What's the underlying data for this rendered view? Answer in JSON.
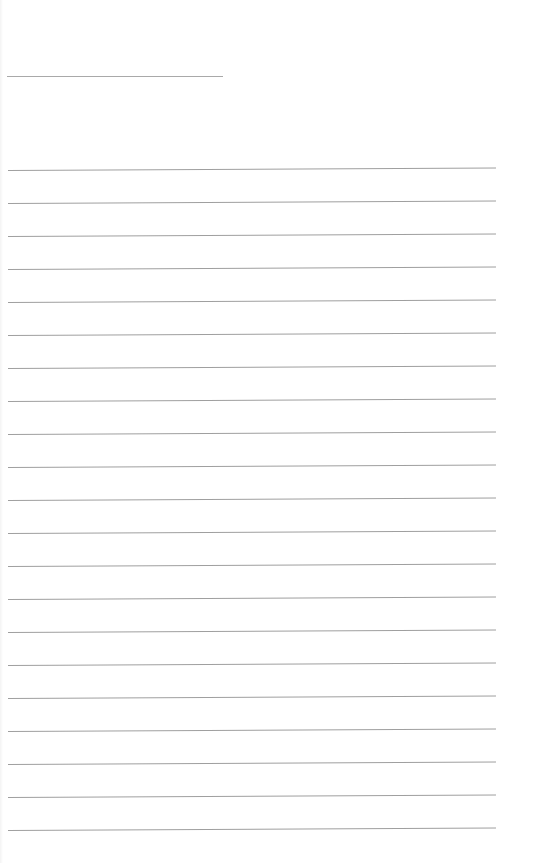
{
  "page": {
    "type": "lined-paper",
    "background_color": "#ffffff",
    "line_color": "#9f9f9f",
    "header_line": {
      "x": 7,
      "y": 76,
      "width": 216
    },
    "ruled_lines": {
      "count": 21,
      "first_y": 167,
      "spacing": 33,
      "x": 8,
      "width": 488
    }
  }
}
